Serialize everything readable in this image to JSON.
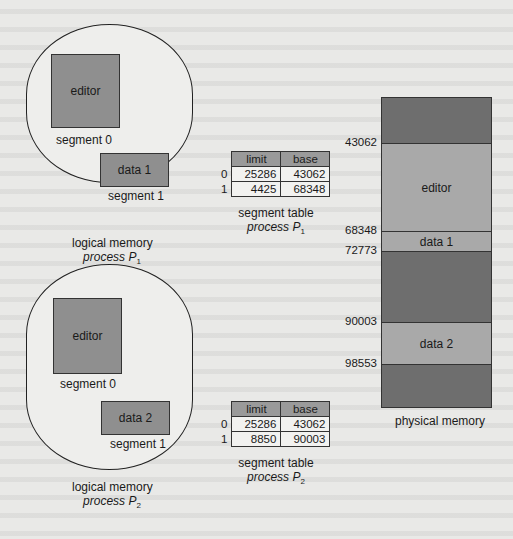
{
  "figure": {
    "process1": {
      "logical_memory": {
        "segments": [
          {
            "name": "editor",
            "label": "segment 0"
          },
          {
            "name": "data 1",
            "label": "segment 1"
          }
        ],
        "caption_line1": "logical memory",
        "caption_line2": "process P",
        "caption_sub": "1"
      },
      "segment_table": {
        "headers": [
          "limit",
          "base"
        ],
        "rows": [
          {
            "index": "0",
            "limit": "25286",
            "base": "43062"
          },
          {
            "index": "1",
            "limit": "4425",
            "base": "68348"
          }
        ],
        "caption_line1": "segment table",
        "caption_line2": "process P",
        "caption_sub": "1"
      }
    },
    "process2": {
      "logical_memory": {
        "segments": [
          {
            "name": "editor",
            "label": "segment 0"
          },
          {
            "name": "data 2",
            "label": "segment 1"
          }
        ],
        "caption_line1": "logical memory",
        "caption_line2": "process P",
        "caption_sub": "2"
      },
      "segment_table": {
        "headers": [
          "limit",
          "base"
        ],
        "rows": [
          {
            "index": "0",
            "limit": "25286",
            "base": "43062"
          },
          {
            "index": "1",
            "limit": "8850",
            "base": "90003"
          }
        ],
        "caption_line1": "segment table",
        "caption_line2": "process P",
        "caption_sub": "2"
      }
    },
    "physical_memory": {
      "caption": "physical memory",
      "addresses": [
        "43062",
        "68348",
        "72773",
        "90003",
        "98553"
      ],
      "blocks": [
        {
          "label": "",
          "type": "free"
        },
        {
          "label": "editor",
          "type": "used"
        },
        {
          "label": "data 1",
          "type": "used"
        },
        {
          "label": "",
          "type": "free"
        },
        {
          "label": "data 2",
          "type": "used"
        },
        {
          "label": "",
          "type": "free"
        }
      ]
    }
  },
  "colors": {
    "used_segment": "#a9a9a9",
    "free_memory": "#6e6e6e",
    "logical_segment": "#8f8f8f",
    "table_header": "#9a9a9a",
    "background": "#e9e9e7"
  }
}
